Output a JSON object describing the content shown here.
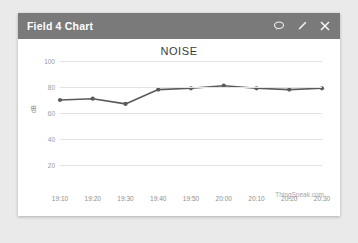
{
  "card": {
    "header": {
      "title": "Field 4 Chart",
      "actions": [
        {
          "name": "comment-icon",
          "label": "Comment"
        },
        {
          "name": "edit-icon",
          "label": "Edit"
        },
        {
          "name": "close-icon",
          "label": "Close"
        }
      ]
    },
    "watermark": "ThingSpeak.com"
  },
  "colors": {
    "header_bg": "#7a7a7a",
    "card_bg": "#ffffff",
    "page_bg": "#eaeaea",
    "line": "#5a5a5a",
    "grid": "#e3e3e3",
    "tick_text": "#8e8e8e",
    "title_text": "#3b3b3b"
  },
  "chart_data": {
    "type": "line",
    "title": "NOISE",
    "xlabel": "",
    "ylabel": "dB",
    "x": [
      "19:10",
      "19:20",
      "19:30",
      "19:40",
      "19:50",
      "20:00",
      "20:10",
      "20:20",
      "20:30"
    ],
    "values": [
      70,
      71,
      67,
      78,
      79,
      81,
      79,
      78,
      79
    ],
    "ylim": [
      20,
      100
    ],
    "yticks": [
      100,
      80,
      60,
      40,
      20
    ],
    "grid": true,
    "legend": false,
    "markers": true,
    "source": "ThingSpeak.com"
  }
}
